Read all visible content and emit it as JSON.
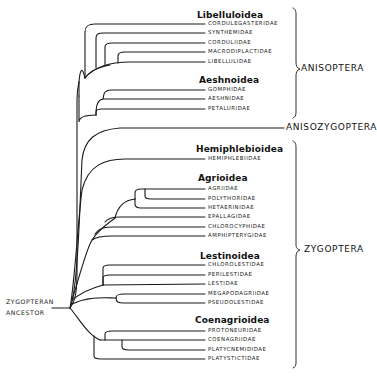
{
  "diagram": {
    "type": "phylogenetic-tree",
    "root": [
      "ZYGOPTERAN",
      "ANCESTOR"
    ],
    "groups": [
      {
        "label": "ANISOPTERA",
        "y": 69
      },
      {
        "label": "ANISOZYGOPTERA",
        "y": 128
      },
      {
        "label": "ZYGOPTERA",
        "y": 250
      }
    ],
    "superfamilies": [
      {
        "name": "Libelluloidea",
        "x": 200,
        "y": 16,
        "families": [
          {
            "name": "CORDULEGASTERIDAE",
            "y": 24
          },
          {
            "name": "SYNTHEMIDAE",
            "y": 33
          },
          {
            "name": "CORDULIIDAE",
            "y": 43
          },
          {
            "name": "MACRODIPLACTIDAE",
            "y": 52
          },
          {
            "name": "LIBELLULIDAE",
            "y": 62
          }
        ]
      },
      {
        "name": "Aeshnoidea",
        "x": 200,
        "y": 81,
        "families": [
          {
            "name": "GOMPHIDAE",
            "y": 90
          },
          {
            "name": "AESHNIDAE",
            "y": 99
          },
          {
            "name": "PETALURIDAE",
            "y": 109
          }
        ]
      },
      {
        "name": "Hemiphlebioidea",
        "x": 197,
        "y": 150,
        "families": [
          {
            "name": "HEMIPHLEBIIDAE",
            "y": 159
          }
        ]
      },
      {
        "name": "Agrioidea",
        "x": 197,
        "y": 179,
        "families": [
          {
            "name": "AGRIIDAE",
            "y": 189
          },
          {
            "name": "POLYTHORIDAE",
            "y": 199
          },
          {
            "name": "HETAERINIDAE",
            "y": 208
          },
          {
            "name": "EPALLAGIDAE",
            "y": 217
          },
          {
            "name": "CHLOROCYPHIDAE",
            "y": 227
          },
          {
            "name": "AMPHIPTERYGIDAE",
            "y": 236
          }
        ]
      },
      {
        "name": "Lestinoidea",
        "x": 200,
        "y": 257,
        "families": [
          {
            "name": "CHLOROLESTIDAE",
            "y": 265
          },
          {
            "name": "PERILESTIDAE",
            "y": 275
          },
          {
            "name": "LESTIDAE",
            "y": 284
          },
          {
            "name": "MEGAPODAGRIIDAE",
            "y": 294
          },
          {
            "name": "PSEUDOLESTIDAE",
            "y": 303
          }
        ]
      },
      {
        "name": "Coenagrioidea",
        "x": 196,
        "y": 321,
        "families": [
          {
            "name": "PROTONEURIDAE",
            "y": 331
          },
          {
            "name": "COENAGRIIDAE",
            "y": 340
          },
          {
            "name": "PLATYCNEMIDIDAE",
            "y": 350
          },
          {
            "name": "PLATYSTICTIDAE",
            "y": 359
          }
        ]
      }
    ]
  },
  "colors": {
    "line": "#1a1a1a",
    "background": "#ffffff"
  }
}
